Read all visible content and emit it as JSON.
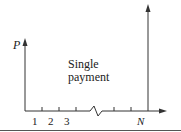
{
  "diagram": {
    "present_label": "P",
    "future_label": "N",
    "caption_line1": "Single",
    "caption_line2": "payment",
    "ticks": [
      "1",
      "2",
      "3"
    ],
    "colors": {
      "line": "#333333",
      "text": "#222222",
      "rule": "#555555"
    }
  }
}
